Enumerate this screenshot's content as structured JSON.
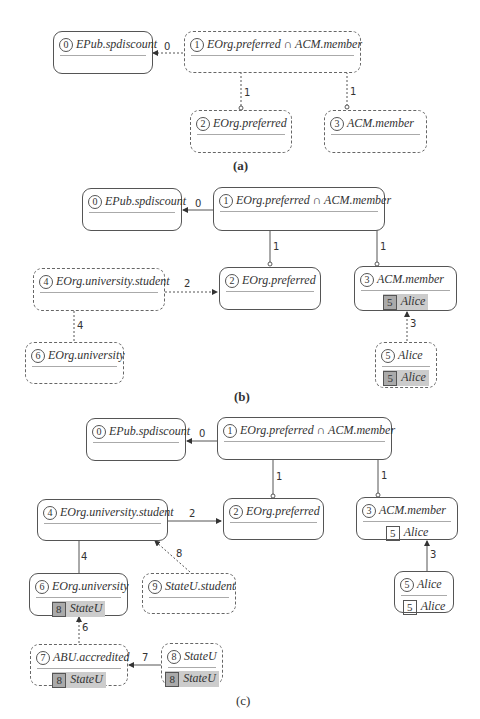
{
  "panels": {
    "a": {
      "caption": "(a)",
      "nodes": [
        {
          "id": "0",
          "label": "EPub.spdiscount"
        },
        {
          "id": "1",
          "label": "EOrg.preferred ∩ ACM.member"
        },
        {
          "id": "2",
          "label": "EOrg.preferred"
        },
        {
          "id": "3",
          "label": "ACM.member"
        }
      ],
      "edges": [
        {
          "label": "0",
          "from": "1",
          "to": "0"
        },
        {
          "label": "1",
          "from": "1",
          "to": "2"
        },
        {
          "label": "1",
          "from": "1",
          "to": "3"
        }
      ]
    },
    "b": {
      "caption": "(b)",
      "nodes": [
        {
          "id": "0",
          "label": "EPub.spdiscount"
        },
        {
          "id": "1",
          "label": "EOrg.preferred ∩ ACM.member"
        },
        {
          "id": "2",
          "label": "EOrg.preferred"
        },
        {
          "id": "3",
          "label": "ACM.member",
          "cred_id": "5",
          "cred": "Alice"
        },
        {
          "id": "4",
          "label": "EOrg.university.student"
        },
        {
          "id": "5",
          "label": "Alice",
          "cred_id": "5",
          "cred": "Alice"
        },
        {
          "id": "6",
          "label": "EOrg.university"
        }
      ],
      "edges": [
        {
          "label": "0",
          "from": "1",
          "to": "0"
        },
        {
          "label": "1",
          "from": "1",
          "to": "2"
        },
        {
          "label": "1",
          "from": "1",
          "to": "3"
        },
        {
          "label": "2",
          "from": "4",
          "to": "2"
        },
        {
          "label": "3",
          "from": "5",
          "to": "3"
        },
        {
          "label": "4",
          "from": "4",
          "to": "6"
        }
      ]
    },
    "c": {
      "caption": "(c)",
      "nodes": [
        {
          "id": "0",
          "label": "EPub.spdiscount"
        },
        {
          "id": "1",
          "label": "EOrg.preferred ∩ ACM.member"
        },
        {
          "id": "2",
          "label": "EOrg.preferred"
        },
        {
          "id": "3",
          "label": "ACM.member",
          "cred_id": "5",
          "cred": "Alice"
        },
        {
          "id": "4",
          "label": "EOrg.university.student"
        },
        {
          "id": "5",
          "label": "Alice",
          "cred_id": "5",
          "cred": "Alice"
        },
        {
          "id": "6",
          "label": "EOrg.university",
          "cred_id": "8",
          "cred": "StateU"
        },
        {
          "id": "7",
          "label": "ABU.accredited",
          "cred_id": "8",
          "cred": "StateU"
        },
        {
          "id": "8",
          "label": "StateU",
          "cred_id": "8",
          "cred": "StateU"
        },
        {
          "id": "9",
          "label": "StateU.student"
        }
      ],
      "edges": [
        {
          "label": "0",
          "from": "1",
          "to": "0"
        },
        {
          "label": "1",
          "from": "1",
          "to": "2"
        },
        {
          "label": "1",
          "from": "1",
          "to": "3"
        },
        {
          "label": "2",
          "from": "4",
          "to": "2"
        },
        {
          "label": "3",
          "from": "5",
          "to": "3"
        },
        {
          "label": "4",
          "from": "4",
          "to": "6"
        },
        {
          "label": "6",
          "from": "7",
          "to": "6"
        },
        {
          "label": "7",
          "from": "8",
          "to": "7"
        },
        {
          "label": "8",
          "from": "9",
          "to": "4"
        }
      ]
    }
  }
}
